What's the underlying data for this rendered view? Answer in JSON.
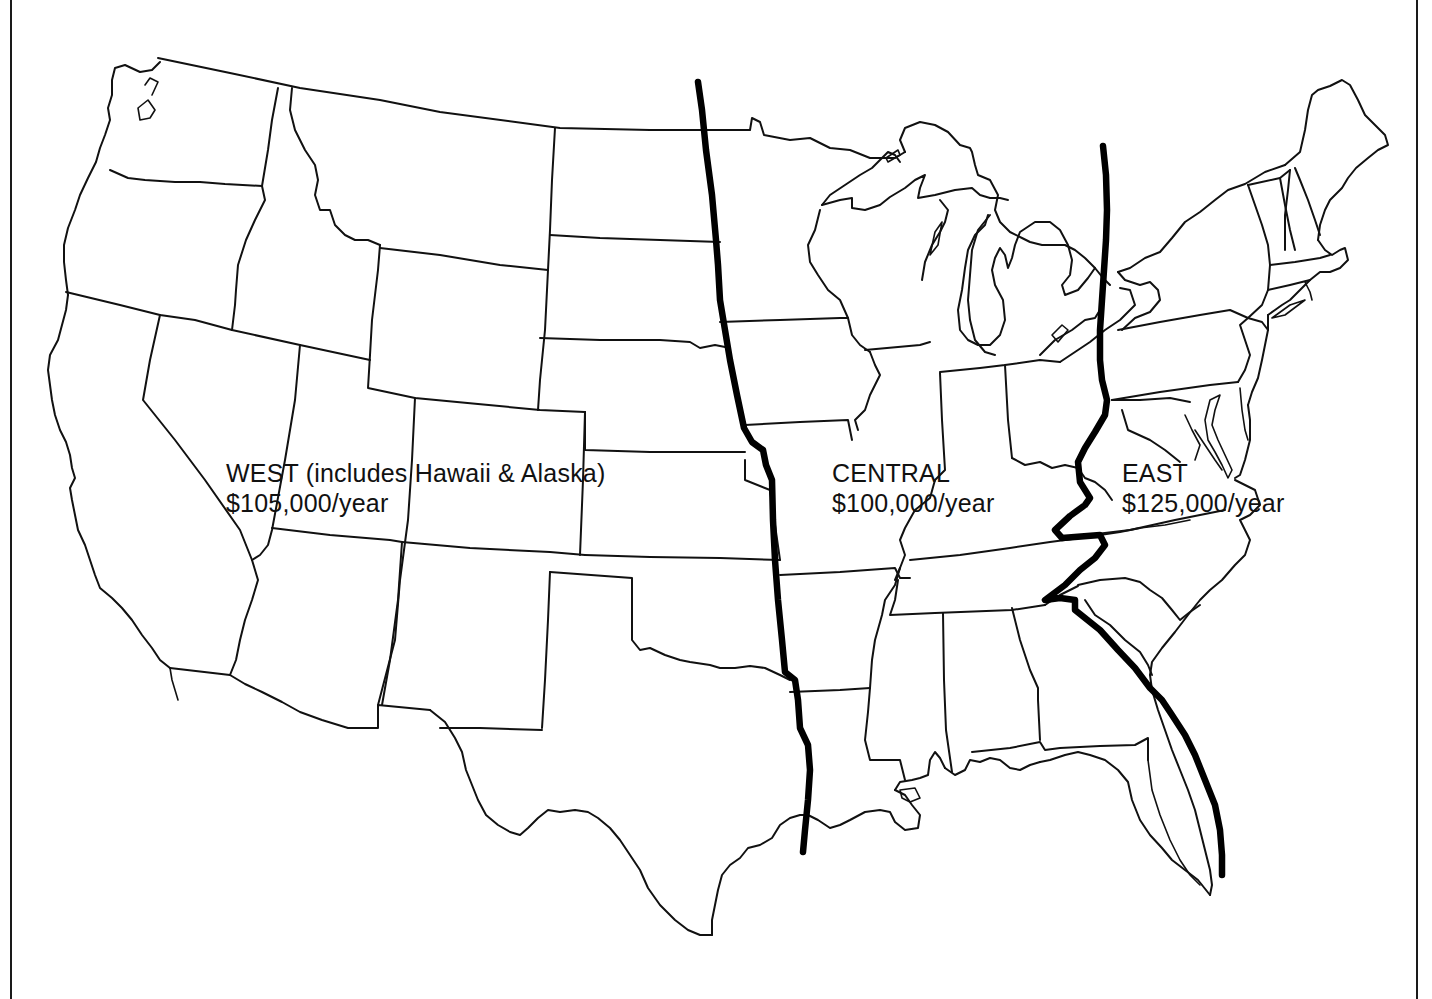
{
  "map": {
    "title": "United States salary regions",
    "regions": [
      {
        "id": "west",
        "name": "WEST (includes Hawaii & Alaska)",
        "rate": "$105,000/year"
      },
      {
        "id": "central",
        "name": "CENTRAL",
        "rate": "$100,000/year"
      },
      {
        "id": "east",
        "name": "EAST",
        "rate": "$125,000/year"
      }
    ],
    "colors": {
      "outline": "#111111",
      "divider": "#000000",
      "background": "#ffffff"
    }
  }
}
